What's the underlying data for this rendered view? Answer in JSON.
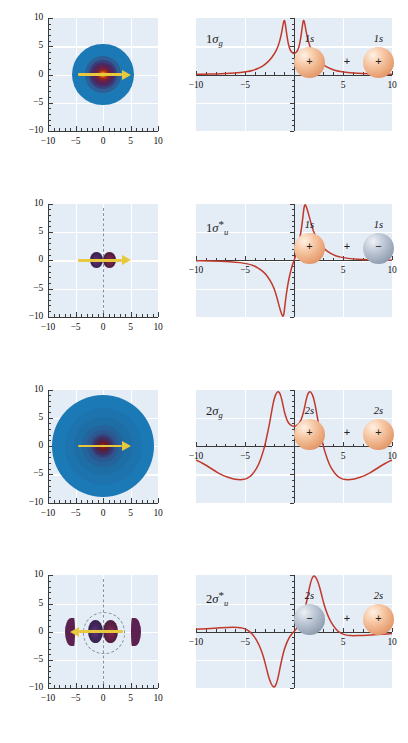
{
  "figure": {
    "rows": 4,
    "background_color": "#e4ecf5",
    "curve_color": "#c0392b",
    "arrow_color": "#e8c83c",
    "positive_lobe_color": "#e79f72",
    "negative_lobe_color": "#97a4b6"
  },
  "axis": {
    "x_ticks": [
      "-10",
      "-5",
      "0",
      "5",
      "10"
    ],
    "y_ticks": [
      "10",
      "5",
      "0",
      "-5",
      "-10"
    ],
    "x_range": [
      -10,
      10
    ],
    "y_range": [
      -10,
      10
    ]
  },
  "rows": [
    {
      "mo_label_base": "1",
      "mo_sigma": "σ",
      "mo_sub": "g",
      "mo_star": "",
      "ao_left_label": "1s",
      "ao_right_label": "1s",
      "ao_left_sign": "+",
      "ao_right_sign": "+",
      "ao_operator": "+",
      "ao_left_type": "pos",
      "ao_right_type": "pos",
      "arrow_direction": "right",
      "has_nodal_plane": false,
      "has_nodal_circle": false
    },
    {
      "mo_label_base": "1",
      "mo_sigma": "σ",
      "mo_sub": "u",
      "mo_star": "*",
      "ao_left_label": "1s",
      "ao_right_label": "1s",
      "ao_left_sign": "+",
      "ao_right_sign": "−",
      "ao_operator": "+",
      "ao_left_type": "pos",
      "ao_right_type": "neg",
      "arrow_direction": "right",
      "has_nodal_plane": true,
      "has_nodal_circle": false
    },
    {
      "mo_label_base": "2",
      "mo_sigma": "σ",
      "mo_sub": "g",
      "mo_star": "",
      "ao_left_label": "2s",
      "ao_right_label": "2s",
      "ao_left_sign": "+",
      "ao_right_sign": "+",
      "ao_operator": "+",
      "ao_left_type": "pos",
      "ao_right_type": "pos",
      "arrow_direction": "right",
      "has_nodal_plane": false,
      "has_nodal_circle": false
    },
    {
      "mo_label_base": "2",
      "mo_sigma": "σ",
      "mo_sub": "u",
      "mo_star": "*",
      "ao_left_label": "2s",
      "ao_right_label": "2s",
      "ao_left_sign": "−",
      "ao_right_sign": "+",
      "ao_operator": "+",
      "ao_left_type": "neg",
      "ao_right_type": "pos",
      "arrow_direction": "left",
      "has_nodal_plane": true,
      "has_nodal_circle": true
    }
  ],
  "chart_data": [
    {
      "type": "line",
      "title": "1σg",
      "xlabel": "",
      "ylabel": "",
      "xlim": [
        -10,
        10
      ],
      "ylim": [
        -10,
        10
      ],
      "grid": true,
      "series": [
        {
          "name": "1sigma_g wavefunction",
          "x": [
            -10,
            -9,
            -8,
            -7,
            -6,
            -5,
            -4.5,
            -4,
            -3.5,
            -3,
            -2.5,
            -2,
            -1.6,
            -1.3,
            -1.1,
            -1.0,
            -0.9,
            -0.7,
            -0.5,
            -0.3,
            0,
            0.3,
            0.5,
            0.7,
            0.9,
            1.0,
            1.1,
            1.3,
            1.6,
            2,
            2.5,
            3,
            3.5,
            4,
            4.5,
            5,
            6,
            7,
            8,
            9,
            10
          ],
          "y": [
            0.05,
            0.07,
            0.1,
            0.15,
            0.25,
            0.45,
            0.6,
            0.85,
            1.2,
            1.7,
            2.5,
            3.6,
            5.0,
            7.0,
            9.0,
            9.7,
            9.2,
            6.5,
            4.8,
            4.0,
            3.6,
            4.0,
            4.8,
            6.5,
            9.2,
            9.7,
            9.0,
            7.0,
            5.0,
            3.6,
            2.5,
            1.7,
            1.2,
            0.85,
            0.6,
            0.45,
            0.25,
            0.15,
            0.1,
            0.07,
            0.05
          ]
        }
      ]
    },
    {
      "type": "line",
      "title": "1σ*u",
      "xlabel": "",
      "ylabel": "",
      "xlim": [
        -10,
        10
      ],
      "ylim": [
        -10,
        10
      ],
      "grid": true,
      "series": [
        {
          "name": "1sigma_u* wavefunction",
          "x": [
            -10,
            -9,
            -8,
            -7,
            -6,
            -5,
            -4.5,
            -4,
            -3.5,
            -3,
            -2.5,
            -2,
            -1.7,
            -1.4,
            -1.2,
            -1.1,
            -1.0,
            -0.8,
            -0.5,
            -0.2,
            0,
            0.2,
            0.5,
            0.8,
            1.0,
            1.1,
            1.2,
            1.4,
            1.7,
            2,
            2.5,
            3,
            3.5,
            4,
            4.5,
            5,
            6,
            7,
            8,
            9,
            10
          ],
          "y": [
            -0.05,
            -0.07,
            -0.1,
            -0.15,
            -0.25,
            -0.5,
            -0.7,
            -1.0,
            -1.5,
            -2.2,
            -3.3,
            -5.0,
            -6.8,
            -8.8,
            -9.8,
            -9.9,
            -9.2,
            -6.0,
            -3.0,
            -1.0,
            0,
            1.0,
            3.0,
            6.0,
            9.2,
            9.9,
            9.8,
            8.8,
            6.8,
            5.0,
            3.3,
            2.2,
            1.5,
            1.0,
            0.7,
            0.5,
            0.25,
            0.15,
            0.1,
            0.07,
            0.05
          ]
        }
      ]
    },
    {
      "type": "line",
      "title": "2σg",
      "xlabel": "",
      "ylabel": "",
      "xlim": [
        -10,
        10
      ],
      "ylim": [
        -10,
        10
      ],
      "grid": true,
      "series": [
        {
          "name": "2sigma_g wavefunction",
          "x": [
            -10,
            -9.5,
            -9,
            -8,
            -7.5,
            -7,
            -6.5,
            -6,
            -5.5,
            -5,
            -4.5,
            -4,
            -3.6,
            -3.2,
            -3,
            -2.8,
            -2.5,
            -2.2,
            -2,
            -1.8,
            -1.6,
            -1.4,
            -1.2,
            -1.0,
            -0.7,
            -0.4,
            0,
            0.4,
            0.7,
            1.0,
            1.2,
            1.4,
            1.6,
            1.8,
            2,
            2.2,
            2.5,
            2.8,
            3,
            3.2,
            3.6,
            4,
            4.5,
            5,
            5.5,
            6,
            6.5,
            7,
            7.5,
            8,
            9,
            9.5,
            10
          ],
          "y": [
            -2.4,
            -2.8,
            -3.3,
            -4.4,
            -4.9,
            -5.3,
            -5.6,
            -5.8,
            -5.9,
            -5.8,
            -5.4,
            -4.4,
            -3.2,
            -1.2,
            0,
            1.5,
            4.0,
            7.0,
            8.6,
            9.5,
            9.8,
            9.3,
            8.0,
            6.2,
            4.5,
            3.8,
            3.5,
            3.8,
            4.5,
            6.2,
            8.0,
            9.3,
            9.8,
            9.5,
            8.6,
            7.0,
            4.0,
            1.5,
            0,
            -1.2,
            -3.2,
            -4.4,
            -5.4,
            -5.8,
            -5.9,
            -5.8,
            -5.6,
            -5.3,
            -4.9,
            -4.4,
            -3.3,
            -2.8,
            -2.4
          ]
        }
      ]
    },
    {
      "type": "line",
      "title": "2σ*u",
      "xlabel": "",
      "ylabel": "",
      "xlim": [
        -10,
        10
      ],
      "ylim": [
        -10,
        10
      ],
      "grid": true,
      "series": [
        {
          "name": "2sigma_u* wavefunction",
          "x": [
            -10,
            -9,
            -8,
            -7,
            -6.5,
            -6,
            -5.5,
            -5,
            -4.5,
            -4,
            -3.6,
            -3.2,
            -3,
            -2.8,
            -2.5,
            -2.2,
            -2,
            -1.8,
            -1.6,
            -1.4,
            -1.2,
            -1.0,
            -0.7,
            -0.4,
            0,
            0.4,
            0.7,
            1.0,
            1.2,
            1.4,
            1.6,
            1.8,
            2,
            2.2,
            2.5,
            2.8,
            3,
            3.2,
            3.6,
            4,
            4.5,
            5,
            5.5,
            6,
            7,
            8,
            9,
            10
          ],
          "y": [
            0.4,
            0.5,
            0.6,
            0.7,
            0.75,
            0.75,
            0.7,
            0.5,
            0.0,
            -1.0,
            -2.2,
            -4.0,
            -5.2,
            -6.6,
            -8.6,
            -9.7,
            -9.9,
            -9.3,
            -8.0,
            -6.2,
            -4.6,
            -3.2,
            -1.8,
            -0.8,
            0,
            0.8,
            1.8,
            3.2,
            4.6,
            6.2,
            8.0,
            9.3,
            9.9,
            9.7,
            8.6,
            6.6,
            5.2,
            4.0,
            2.2,
            1.0,
            0.0,
            -0.5,
            -0.7,
            -0.75,
            -0.7,
            -0.6,
            -0.5,
            -0.4
          ]
        }
      ]
    }
  ]
}
